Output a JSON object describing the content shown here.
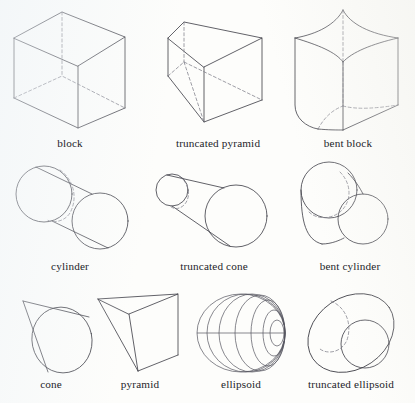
{
  "figure": {
    "background_color": "#fdfdfb",
    "line_color": "#3a3a42",
    "hidden_line_color": "#7d7d88",
    "width": 415,
    "height": 403
  },
  "rows": [
    {
      "row_index": 1,
      "caption_y": 137,
      "items": [
        {
          "id": "block",
          "label": "block",
          "caption_x": 70,
          "kind": "polyhedron"
        },
        {
          "id": "truncated-pyramid",
          "label": "truncated pyramid",
          "caption_x": 218,
          "kind": "polyhedron"
        },
        {
          "id": "bent-block",
          "label": "bent block",
          "caption_x": 348,
          "kind": "curved-polyhedron"
        }
      ]
    },
    {
      "row_index": 2,
      "caption_y": 260,
      "items": [
        {
          "id": "cylinder",
          "label": "cylinder",
          "caption_x": 70,
          "kind": "solid-of-revolution"
        },
        {
          "id": "truncated-cone",
          "label": "truncated cone",
          "caption_x": 214,
          "kind": "solid-of-revolution"
        },
        {
          "id": "bent-cylinder",
          "label": "bent cylinder",
          "caption_x": 350,
          "kind": "solid-of-revolution"
        }
      ]
    },
    {
      "row_index": 3,
      "caption_y": 378,
      "items": [
        {
          "id": "cone",
          "label": "cone",
          "caption_x": 51,
          "kind": "solid-of-revolution"
        },
        {
          "id": "pyramid",
          "label": "pyramid",
          "caption_x": 140,
          "kind": "polyhedron"
        },
        {
          "id": "ellipsoid",
          "label": "ellipsoid",
          "caption_x": 241,
          "kind": "quadric"
        },
        {
          "id": "truncated-ellipsoid",
          "label": "truncated ellipsoid",
          "caption_x": 351,
          "kind": "quadric"
        }
      ]
    }
  ],
  "labels": {
    "block": "block",
    "truncated_pyramid": "truncated pyramid",
    "bent_block": "bent block",
    "cylinder": "cylinder",
    "truncated_cone": "truncated cone",
    "bent_cylinder": "bent cylinder",
    "cone": "cone",
    "pyramid": "pyramid",
    "ellipsoid": "ellipsoid",
    "truncated_ellipsoid": "truncated ellipsoid"
  }
}
